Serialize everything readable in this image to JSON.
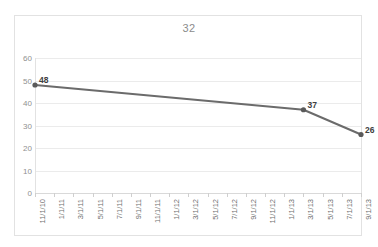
{
  "chart_data": {
    "type": "line",
    "title": "32",
    "xlabel": "",
    "ylabel": "",
    "ylim": [
      0,
      60
    ],
    "ytick_step": 10,
    "yticks": [
      60,
      50,
      40,
      30,
      20,
      10,
      0
    ],
    "grid": "horizontal",
    "legend": "none",
    "categories": [
      "11/1/10",
      "1/1/11",
      "3/1/11",
      "5/1/11",
      "7/1/11",
      "9/1/11",
      "11/1/11",
      "1/1/12",
      "3/1/12",
      "5/1/12",
      "7/1/12",
      "9/1/12",
      "11/1/12",
      "1/1/13",
      "3/1/13",
      "5/1/13",
      "7/1/13",
      "9/1/13"
    ],
    "series": [
      {
        "name": "32",
        "color": "#6b6b6b",
        "marker": "circle",
        "points": [
          {
            "x": "11/1/10",
            "x_index": 0,
            "y": 48,
            "label": "48"
          },
          {
            "x": "3/1/13",
            "x_index": 14,
            "y": 37,
            "label": "37"
          },
          {
            "x": "9/1/13",
            "x_index": 17,
            "y": 26,
            "label": "26"
          }
        ]
      }
    ],
    "data_labels": [
      "48",
      "37",
      "26"
    ]
  },
  "style": {
    "line_color": "#6b6b6b",
    "marker_color": "#5a5a5a",
    "grid_color": "#ebebeb",
    "axis_color": "#d9d9d9",
    "frame_color": "#e2e2e2",
    "title_color": "#8c8c8c",
    "tick_label_color": "#6f6f6f",
    "background": "#ffffff"
  }
}
